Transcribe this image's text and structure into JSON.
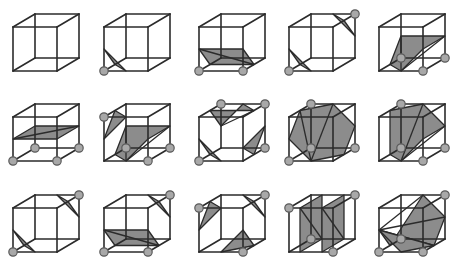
{
  "figure": {
    "title": "",
    "colors": {
      "edge": "#2b2b2b",
      "surface_fill": "#8c8c8c",
      "vertex_fill": "#a8a8a8",
      "vertex_stroke": "#5a5a5a",
      "background": "#ffffff"
    },
    "layout": {
      "columns": 5,
      "rows": 3,
      "cube_size": 44,
      "depth_offset": [
        22,
        -13
      ],
      "column_x": [
        13,
        104,
        199,
        289,
        379
      ],
      "row_y": [
        27,
        117,
        208
      ]
    }
  },
  "cases": [
    {
      "id": 0,
      "row": 0,
      "col": 0,
      "vertices": [],
      "polygons": []
    },
    {
      "id": 1,
      "row": 0,
      "col": 1,
      "vertices": [
        [
          0,
          0,
          0
        ]
      ],
      "polygons": [
        [
          [
            0.5,
            0,
            0
          ],
          [
            0,
            0.5,
            0
          ],
          [
            0,
            0,
            0.5
          ]
        ]
      ]
    },
    {
      "id": 2,
      "row": 0,
      "col": 2,
      "vertices": [
        [
          0,
          0,
          0
        ],
        [
          1,
          0,
          0
        ]
      ],
      "polygons": [
        [
          [
            0,
            0.5,
            0
          ],
          [
            1,
            0.5,
            0
          ],
          [
            1,
            0,
            0.5
          ],
          [
            0,
            0,
            0.5
          ]
        ]
      ]
    },
    {
      "id": 3,
      "row": 0,
      "col": 3,
      "vertices": [
        [
          0,
          0,
          0
        ],
        [
          1,
          1,
          1
        ]
      ],
      "polygons": [
        [
          [
            0.5,
            0,
            0
          ],
          [
            0,
            0.5,
            0
          ],
          [
            0,
            0,
            0.5
          ]
        ],
        [
          [
            0.5,
            1,
            1
          ],
          [
            1,
            1,
            0.5
          ],
          [
            1,
            0.5,
            1
          ]
        ]
      ]
    },
    {
      "id": 4,
      "row": 0,
      "col": 4,
      "vertices": [
        [
          1,
          0,
          0
        ],
        [
          1,
          0,
          1
        ],
        [
          0,
          0,
          1
        ]
      ],
      "polygons": [
        [
          [
            0.5,
            0,
            0
          ],
          [
            1,
            0.5,
            0
          ],
          [
            1,
            0.5,
            1
          ],
          [
            0,
            0.5,
            1
          ],
          [
            0,
            0,
            0.5
          ]
        ]
      ]
    },
    {
      "id": 5,
      "row": 1,
      "col": 0,
      "vertices": [
        [
          0,
          0,
          0
        ],
        [
          1,
          0,
          0
        ],
        [
          1,
          0,
          1
        ],
        [
          0,
          0,
          1
        ]
      ],
      "polygons": [
        [
          [
            0,
            0.5,
            0
          ],
          [
            1,
            0.5,
            0
          ],
          [
            1,
            0.5,
            1
          ],
          [
            0,
            0.5,
            1
          ]
        ]
      ]
    },
    {
      "id": 6,
      "row": 1,
      "col": 1,
      "vertices": [
        [
          0,
          1,
          0
        ],
        [
          1,
          0,
          0
        ],
        [
          1,
          0,
          1
        ],
        [
          0,
          0,
          1
        ]
      ],
      "polygons": [
        [
          [
            0.5,
            1,
            0
          ],
          [
            0,
            0.5,
            0
          ],
          [
            0,
            1,
            0.5
          ]
        ],
        [
          [
            0.5,
            0,
            0
          ],
          [
            1,
            0.5,
            0
          ],
          [
            1,
            0.5,
            1
          ],
          [
            0,
            0.5,
            1
          ],
          [
            0,
            0,
            0.5
          ]
        ]
      ]
    },
    {
      "id": 7,
      "row": 1,
      "col": 2,
      "vertices": [
        [
          0,
          0,
          0
        ],
        [
          0,
          1,
          1
        ],
        [
          1,
          1,
          1
        ],
        [
          1,
          0,
          1
        ]
      ],
      "polygons": [
        [
          [
            0.5,
            0,
            0
          ],
          [
            0,
            0.5,
            0
          ],
          [
            0,
            0,
            0.5
          ]
        ],
        [
          [
            0,
            0.5,
            1
          ],
          [
            0,
            1,
            0.5
          ],
          [
            1,
            1,
            0.5
          ],
          [
            0.5,
            1,
            1
          ]
        ],
        [
          [
            1,
            0,
            0.5
          ],
          [
            1,
            0.5,
            1
          ],
          [
            0.5,
            0,
            1
          ]
        ]
      ]
    },
    {
      "id": 8,
      "row": 1,
      "col": 3,
      "vertices": [
        [
          0,
          0,
          0
        ],
        [
          0,
          1,
          1
        ],
        [
          1,
          0,
          1
        ],
        [
          0,
          0,
          1
        ]
      ],
      "polygons": [
        [
          [
            0.5,
            0,
            0
          ],
          [
            0,
            0.5,
            0
          ],
          [
            0,
            1,
            0.5
          ],
          [
            0.5,
            1,
            1
          ],
          [
            1,
            0.5,
            1
          ],
          [
            1,
            0,
            0.5
          ]
        ]
      ]
    },
    {
      "id": 9,
      "row": 1,
      "col": 4,
      "vertices": [
        [
          1,
          0,
          0
        ],
        [
          0,
          1,
          1
        ],
        [
          0,
          0,
          1
        ],
        [
          1,
          0,
          1
        ]
      ],
      "polygons": [
        [
          [
            0.5,
            0,
            0
          ],
          [
            1,
            0.5,
            0
          ],
          [
            1,
            0.5,
            1
          ],
          [
            0.5,
            1,
            1
          ],
          [
            0,
            1,
            0.5
          ],
          [
            0,
            0,
            0.5
          ]
        ]
      ]
    },
    {
      "id": 10,
      "row": 2,
      "col": 0,
      "vertices": [
        [
          0,
          0,
          0
        ],
        [
          1,
          1,
          1
        ]
      ],
      "polygons": [
        [
          [
            0.5,
            0,
            0
          ],
          [
            0,
            0.5,
            0
          ],
          [
            0,
            0,
            0.5
          ]
        ],
        [
          [
            0.5,
            1,
            1
          ],
          [
            1,
            1,
            0.5
          ],
          [
            1,
            0.5,
            1
          ]
        ]
      ]
    },
    {
      "id": 11,
      "row": 2,
      "col": 1,
      "vertices": [
        [
          0,
          0,
          0
        ],
        [
          1,
          0,
          0
        ],
        [
          1,
          1,
          1
        ]
      ],
      "polygons": [
        [
          [
            0,
            0.5,
            0
          ],
          [
            1,
            0.5,
            0
          ],
          [
            1,
            0,
            0.5
          ],
          [
            0,
            0,
            0.5
          ]
        ],
        [
          [
            0.5,
            1,
            1
          ],
          [
            1,
            1,
            0.5
          ],
          [
            1,
            0.5,
            1
          ]
        ]
      ]
    },
    {
      "id": 12,
      "row": 2,
      "col": 2,
      "vertices": [
        [
          0,
          1,
          0
        ],
        [
          1,
          0,
          0
        ],
        [
          1,
          1,
          1
        ]
      ],
      "polygons": [
        [
          [
            0.5,
            1,
            0
          ],
          [
            0,
            0.5,
            0
          ],
          [
            0,
            1,
            0.5
          ]
        ],
        [
          [
            0.5,
            0,
            0
          ],
          [
            1,
            0.5,
            0
          ],
          [
            1,
            0,
            0.5
          ]
        ],
        [
          [
            0.5,
            1,
            1
          ],
          [
            1,
            1,
            0.5
          ],
          [
            1,
            0.5,
            1
          ]
        ]
      ]
    },
    {
      "id": 13,
      "row": 2,
      "col": 3,
      "vertices": [
        [
          0,
          1,
          0
        ],
        [
          1,
          0,
          0
        ],
        [
          1,
          1,
          1
        ],
        [
          0,
          0,
          1
        ]
      ],
      "polygons": [
        [
          [
            0.25,
            1,
            0
          ],
          [
            0.25,
            0,
            0
          ],
          [
            0.25,
            0,
            1
          ],
          [
            0.25,
            1,
            1
          ]
        ],
        [
          [
            0.75,
            1,
            0
          ],
          [
            0.75,
            0,
            0
          ],
          [
            0.75,
            0,
            1
          ],
          [
            0.75,
            1,
            1
          ]
        ]
      ]
    },
    {
      "id": 14,
      "row": 2,
      "col": 4,
      "vertices": [
        [
          0,
          0,
          0
        ],
        [
          1,
          0,
          0
        ],
        [
          1,
          1,
          1
        ],
        [
          0,
          0,
          1
        ]
      ],
      "polygons": [
        [
          [
            0,
            0.5,
            0
          ],
          [
            1,
            0,
            0.5
          ],
          [
            1,
            0.5,
            1
          ],
          [
            0.5,
            1,
            1
          ],
          [
            0,
            0,
            0.5
          ]
        ],
        [
          [
            0,
            0.5,
            0
          ],
          [
            0.5,
            0,
            0
          ],
          [
            1,
            0,
            0.5
          ]
        ]
      ]
    }
  ]
}
